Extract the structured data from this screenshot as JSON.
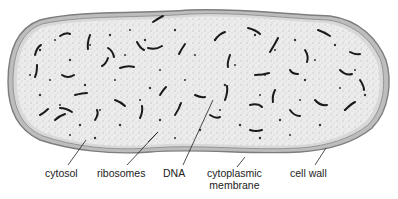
{
  "figure": {
    "colors": {
      "background": "#ffffff",
      "cell_wall_outer": "#8a8a8a",
      "membrane": "#9a9a9a",
      "cytosol_fill": "#e9e9e9",
      "dna": "#1a1a1a",
      "ribosome": "#333333",
      "leader_line": "#222222",
      "label_text": "#222222"
    },
    "labels": [
      {
        "id": "cytosol",
        "text": "cytosol",
        "x": 49,
        "y": 166,
        "line": [
          86,
          140,
          68,
          165
        ]
      },
      {
        "id": "ribosomes",
        "text": "ribosomes",
        "x": 96,
        "y": 166,
        "line": [
          158,
          132,
          127,
          165
        ]
      },
      {
        "id": "dna",
        "text": "DNA",
        "x": 164,
        "y": 166,
        "line": [
          213,
          100,
          183,
          165
        ]
      },
      {
        "id": "cytoplasmic-membrane",
        "text": "cytoplasmic",
        "text2": "membrane",
        "x": 207,
        "y": 166,
        "line": [
          245,
          157,
          237,
          167
        ]
      },
      {
        "id": "cell-wall",
        "text": "cell wall",
        "x": 290,
        "y": 166,
        "line": [
          326,
          148,
          315,
          165
        ]
      }
    ]
  }
}
